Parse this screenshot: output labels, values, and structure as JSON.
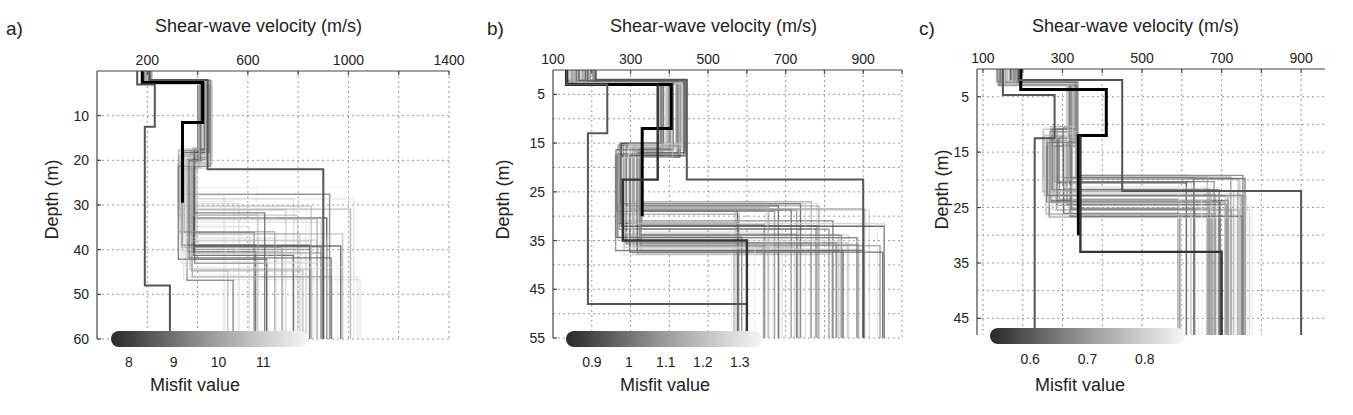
{
  "chart_data": [
    {
      "panel": "a)",
      "type": "line",
      "title": "Shear-wave velocity (m/s)",
      "xlabel": "Shear-wave velocity (m/s)",
      "ylabel": "Depth (m)",
      "xlim": [
        0,
        1400
      ],
      "ylim": [
        60,
        0
      ],
      "x_ticks": [
        200,
        600,
        1000,
        1400
      ],
      "x_grid": [
        200,
        400,
        600,
        800,
        1000,
        1200,
        1400
      ],
      "y_ticks": [
        10,
        20,
        30,
        40,
        50,
        60
      ],
      "grid": true,
      "colorbar": {
        "label": "Misfit value",
        "ticks": [
          8,
          9,
          10,
          11
        ],
        "range": [
          7.6,
          12.0
        ],
        "colormap": "black-to-white"
      },
      "series": [
        {
          "name": "best model",
          "style": "thick-black",
          "vs": [
            180,
            180,
            420,
            420,
            340,
            340
          ],
          "depth": [
            0,
            2.6,
            2.6,
            11.5,
            11.5,
            29.5
          ]
        },
        {
          "name": "search bound min",
          "style": "bound",
          "vs": [
            160,
            160,
            230,
            230,
            190,
            190,
            290,
            290
          ],
          "depth": [
            0,
            3.0,
            3.0,
            12.5,
            12.5,
            48,
            48,
            60
          ]
        },
        {
          "name": "search bound max",
          "style": "bound",
          "vs": [
            210,
            210,
            440,
            440,
            900,
            900
          ],
          "depth": [
            0,
            2.0,
            2.0,
            22,
            22,
            60
          ]
        }
      ],
      "ensemble_layers": {
        "layer1_vs_range": [
          180,
          220
        ],
        "layer1_depth": [
          0,
          3
        ],
        "layer2_vs_range": [
          400,
          460
        ],
        "layer2_depth": [
          3,
          20
        ],
        "layer3_vs_range": [
          320,
          400
        ],
        "layer3_depth": [
          17,
          35
        ],
        "halfspace_vs_range": [
          500,
          1050
        ],
        "halfspace_top_range": [
          26,
          47
        ]
      }
    },
    {
      "panel": "b)",
      "type": "line",
      "title": "Shear-wave velocity (m/s)",
      "xlabel": "Shear-wave velocity (m/s)",
      "ylabel": "Depth (m)",
      "xlim": [
        100,
        1000
      ],
      "ylim": [
        55,
        0
      ],
      "x_ticks": [
        100,
        300,
        500,
        700,
        900
      ],
      "x_grid": [
        200,
        300,
        400,
        500,
        600,
        700,
        800,
        900,
        1000
      ],
      "y_ticks": [
        5,
        15,
        25,
        35,
        45,
        55
      ],
      "grid": true,
      "colorbar": {
        "label": "Misfit value",
        "ticks": [
          0.9,
          1,
          1.1,
          1.2,
          1.3
        ],
        "range": [
          0.83,
          1.36
        ],
        "colormap": "black-to-white"
      },
      "series": [
        {
          "name": "best model",
          "style": "thick-black",
          "vs": [
            135,
            135,
            405,
            405,
            330,
            330
          ],
          "depth": [
            0,
            3.0,
            3.0,
            12.0,
            12.0,
            30
          ]
        },
        {
          "name": "search bound min",
          "style": "bound",
          "vs": [
            135,
            135,
            240,
            240,
            190,
            190,
            600,
            600
          ],
          "depth": [
            0,
            3.0,
            3.0,
            13.0,
            13.0,
            48,
            48,
            55
          ]
        },
        {
          "name": "search bound max",
          "style": "bound",
          "vs": [
            210,
            210,
            445,
            445,
            900,
            900
          ],
          "depth": [
            0,
            2.0,
            2.0,
            22.5,
            22.5,
            55
          ]
        },
        {
          "name": "best model b2",
          "style": "dark",
          "vs": [
            370,
            370,
            280,
            280,
            600,
            600
          ],
          "depth": [
            3,
            22.5,
            22.5,
            35,
            35,
            54
          ]
        }
      ],
      "ensemble_layers": {
        "layer1_vs_range": [
          130,
          210
        ],
        "layer1_depth": [
          0,
          3
        ],
        "layer2_vs_range": [
          370,
          445
        ],
        "layer2_depth": [
          3,
          16
        ],
        "layer3_vs_range": [
          260,
          330
        ],
        "layer3_depth": [
          15,
          37
        ],
        "halfspace_vs_range": [
          560,
          960
        ],
        "halfspace_top_range": [
          27,
          38
        ]
      }
    },
    {
      "panel": "c)",
      "type": "line",
      "title": "Shear-wave velocity (m/s)",
      "xlabel": "Shear-wave velocity (m/s)",
      "ylabel": "Depth (m)",
      "xlim": [
        85,
        960
      ],
      "ylim": [
        48,
        0
      ],
      "x_ticks": [
        100,
        300,
        500,
        700,
        900
      ],
      "x_grid": [
        100,
        200,
        300,
        400,
        500,
        600,
        700,
        800,
        900
      ],
      "y_ticks": [
        5,
        15,
        25,
        35,
        45
      ],
      "grid": true,
      "colorbar": {
        "label": "Misfit value",
        "ticks": [
          0.6,
          0.7,
          0.8
        ],
        "range": [
          0.53,
          0.87
        ],
        "colormap": "black-to-white"
      },
      "series": [
        {
          "name": "best model",
          "style": "thick-black",
          "vs": [
            195,
            195,
            410,
            410,
            340,
            340
          ],
          "depth": [
            0,
            3.7,
            3.7,
            12.0,
            12.0,
            30
          ]
        },
        {
          "name": "search bound min",
          "style": "bound",
          "vs": [
            150,
            150,
            280,
            280,
            230,
            230
          ],
          "depth": [
            0,
            4.7,
            4.7,
            12.5,
            12.5,
            48
          ]
        },
        {
          "name": "search bound max",
          "style": "bound",
          "vs": [
            190,
            190,
            450,
            450,
            900,
            900
          ],
          "depth": [
            0,
            2.0,
            2.0,
            22.0,
            22.0,
            48
          ]
        },
        {
          "name": "secondary model",
          "style": "dark",
          "vs": [
            345,
            345,
            700,
            700
          ],
          "depth": [
            12,
            33,
            33,
            48
          ]
        }
      ],
      "ensemble_layers": {
        "layer1_vs_range": [
          130,
          200
        ],
        "layer1_depth": [
          0,
          3
        ],
        "layer2_vs_range": [
          310,
          340
        ],
        "layer2_depth": [
          3,
          12
        ],
        "layer3_vs_range": [
          250,
          340
        ],
        "layer3_depth": [
          10,
          27
        ],
        "halfspace_vs_range": [
          590,
          780
        ],
        "halfspace_top_range": [
          19,
          27
        ]
      }
    }
  ],
  "panels": [
    {
      "label": "a)",
      "xlabel": "Shear-wave velocity (m/s)",
      "ylabel": "Depth (m)",
      "misfit_label": "Misfit value"
    },
    {
      "label": "b)",
      "xlabel": "Shear-wave velocity (m/s)",
      "ylabel": "Depth (m)",
      "misfit_label": "Misfit value"
    },
    {
      "label": "c)",
      "xlabel": "Shear-wave velocity (m/s)",
      "ylabel": "Depth (m)",
      "misfit_label": "Misfit value"
    }
  ],
  "layout": [
    {
      "left": 0,
      "plot": {
        "x0": 97,
        "x1": 449,
        "y0": 71,
        "y1": 339
      },
      "title_x": 155,
      "label_x": 6,
      "ylabel_cx": 52,
      "ylabel_cy": 200,
      "misfit_x": 150,
      "cbar": {
        "x0": 111,
        "x1": 308,
        "y": 339
      }
    },
    {
      "left": 0,
      "plot": {
        "x0": 553,
        "x1": 902,
        "y0": 70,
        "y1": 338
      },
      "title_x": 610,
      "label_x": 487,
      "ylabel_cx": 503,
      "ylabel_cy": 200,
      "misfit_x": 620,
      "cbar": {
        "x0": 566,
        "x1": 762,
        "y": 339
      }
    },
    {
      "left": 0,
      "plot": {
        "x0": 977,
        "x1": 1325,
        "y0": 69,
        "y1": 335
      },
      "title_x": 1032,
      "label_x": 919,
      "ylabel_cx": 942,
      "ylabel_cy": 190,
      "misfit_x": 1035,
      "cbar": {
        "x0": 990,
        "x1": 1185,
        "y": 336
      }
    }
  ]
}
